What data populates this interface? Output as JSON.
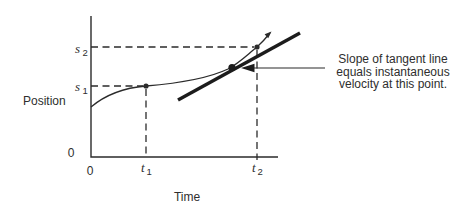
{
  "figure": {
    "colors": {
      "background": "#ffffff",
      "ink": "#2b2b2b",
      "text": "#2e2e2e"
    },
    "y_axis": {
      "title": "Position",
      "origin_label": "0",
      "tick_labels": [
        {
          "base": "s",
          "sub": "2"
        },
        {
          "base": "s",
          "sub": "1"
        }
      ]
    },
    "x_axis": {
      "title": "Time",
      "origin_label": "0",
      "tick_labels": [
        {
          "base": "t",
          "sub": "1"
        },
        {
          "base": "t",
          "sub": "2"
        }
      ]
    },
    "annotation": {
      "line1": "Slope of tangent line",
      "line2": "equals instantaneous",
      "line3": "velocity at this point."
    }
  }
}
